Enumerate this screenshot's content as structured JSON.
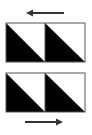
{
  "diagram": {
    "colors": {
      "fill": "#000000",
      "background": "#ffffff",
      "border": "#555555",
      "arrow": "#333333"
    },
    "top_arrow": {
      "direction": "left",
      "icon": "arrow-left-icon"
    },
    "bottom_arrow": {
      "direction": "right",
      "icon": "arrow-right-icon"
    },
    "rows": [
      {
        "cells": [
          {
            "pattern": "diagonal-black-lower-left"
          },
          {
            "pattern": "diagonal-black-lower-left"
          }
        ]
      },
      {
        "cells": [
          {
            "pattern": "diagonal-black-lower-left"
          },
          {
            "pattern": "diagonal-black-lower-left"
          }
        ]
      }
    ]
  }
}
